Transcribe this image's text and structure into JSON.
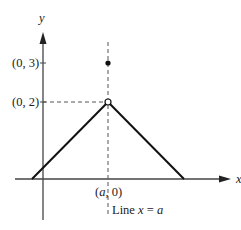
{
  "diagram": {
    "axes": {
      "x_label": "x",
      "y_label": "y"
    },
    "points": {
      "filled_point_label": "(0, 3)",
      "open_point_label": "(0, 2)",
      "base_point_label": "(a, 0)"
    },
    "line_label": {
      "prefix": "Line ",
      "var": "x",
      "eq": " = ",
      "val": "a"
    },
    "colors": {
      "ink": "#222222",
      "background": "#ffffff"
    }
  }
}
